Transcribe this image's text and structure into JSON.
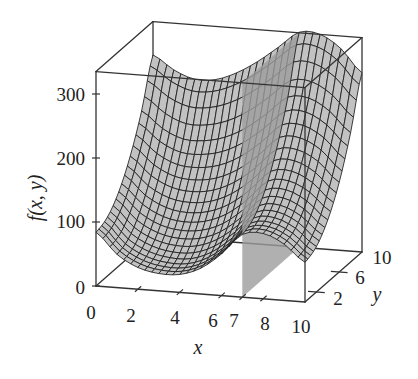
{
  "figure": {
    "background": "#ffffff"
  },
  "axes": {
    "zlabel": "f(x, y)",
    "xlabel": "x",
    "ylabel": "y",
    "z_tick_labels": [
      "0",
      "100",
      "200",
      "300"
    ],
    "x_tick_labels": [
      "0",
      "2",
      "4",
      "6",
      "7",
      "8",
      "10"
    ],
    "y_tick_labels": [
      "2",
      "6",
      "10"
    ]
  },
  "chart_data": {
    "type": "surface3d",
    "title": "",
    "xlabel": "x",
    "ylabel": "y",
    "zlabel": "f(x, y)",
    "xlim": [
      0,
      10
    ],
    "ylim": [
      0,
      10
    ],
    "zlim": [
      0,
      335
    ],
    "x_ticks": [
      0,
      2,
      4,
      6,
      7,
      8,
      10
    ],
    "y_ticks": [
      2,
      6,
      10
    ],
    "z_ticks": [
      0,
      100,
      200,
      300
    ],
    "grid": {
      "x": [
        0,
        1,
        2,
        3,
        4,
        5,
        6,
        7,
        8,
        9,
        10
      ],
      "y": [
        0,
        2,
        4,
        6,
        8,
        10
      ],
      "z": [
        [
          84,
          52,
          34,
          27,
          28,
          40,
          65,
          98,
          102,
          88,
          62
        ],
        [
          92,
          60,
          43,
          36,
          37,
          50,
          75,
          108,
          111,
          97,
          71
        ],
        [
          116,
          86,
          69,
          63,
          66,
          79,
          104,
          136,
          139,
          124,
          97
        ],
        [
          156,
          128,
          112,
          108,
          113,
          128,
          153,
          184,
          186,
          170,
          140
        ],
        [
          211,
          186,
          172,
          172,
          180,
          197,
          222,
          250,
          251,
          233,
          202
        ],
        [
          283,
          262,
          250,
          252,
          265,
          285,
          310,
          336,
          335,
          315,
          280
        ]
      ]
    },
    "cutting_plane": {
      "axis": "x",
      "value": 7
    },
    "colors": {
      "surface": "#c2c2c2",
      "mesh": "#1e1e1e",
      "plane": "#9c9c9c",
      "axes": "#333333"
    },
    "grid_lines": false,
    "legend": null
  }
}
